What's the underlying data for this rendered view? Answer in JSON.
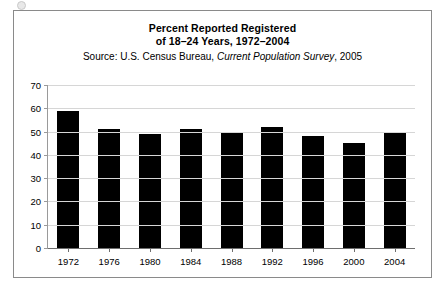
{
  "chart_data": {
    "type": "bar",
    "title": "Percent Reported Registered",
    "title_line2": "of 18–24 Years, 1972–2004",
    "source": {
      "prefix": "Source: U.S. Census Bureau,",
      "publication": "Current Population Survey",
      "suffix": ", 2005"
    },
    "categories": [
      "1972",
      "1976",
      "1980",
      "1984",
      "1988",
      "1992",
      "1996",
      "2000",
      "2004"
    ],
    "values": [
      59,
      51,
      49,
      51,
      50,
      52,
      48,
      45,
      50
    ],
    "xlabel": "",
    "ylabel": "",
    "ylim": [
      0,
      70
    ],
    "ytick_step": 10,
    "yticks": [
      "70",
      "60",
      "50",
      "40",
      "30",
      "20",
      "10",
      "0"
    ],
    "grid": true,
    "legend": "none",
    "bar_color": "#000000",
    "gridline_color": "#d6d6d6",
    "axis_color": "#6e6e6e",
    "frame_color": "#8a8a8a"
  }
}
